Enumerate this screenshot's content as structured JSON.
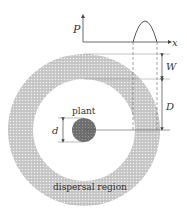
{
  "labels": {
    "p_axis": "P",
    "x_axis": "x",
    "width": "W",
    "distance": "D",
    "diameter": "d",
    "plant": "plant",
    "region": "dispersal region"
  },
  "colors": {
    "ring_fill": "#b8b8b8",
    "plant_fill": "#7a7a7a",
    "line": "#444444",
    "guide": "#9a9a9a"
  }
}
